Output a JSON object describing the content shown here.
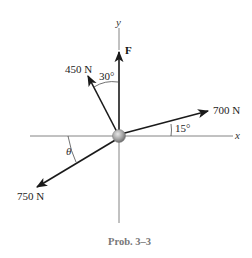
{
  "diagram": {
    "caption": "Prob. 3–3",
    "axes": {
      "x_label": "x",
      "y_label": "y"
    },
    "forces": [
      {
        "id": "F",
        "label": "F",
        "direction": "along +y"
      },
      {
        "id": "f450",
        "label": "450 N",
        "angle_label": "30°",
        "angle_ref": "from +y toward -x"
      },
      {
        "id": "f700",
        "label": "700 N",
        "angle_label": "15°",
        "angle_ref": "above +x"
      },
      {
        "id": "f750",
        "label": "750 N",
        "angle_label": "θ",
        "angle_ref": "below -x"
      }
    ],
    "colors": {
      "line": "#1a1a1a",
      "axis": "#555555",
      "particle": "#9a9a9a"
    }
  }
}
